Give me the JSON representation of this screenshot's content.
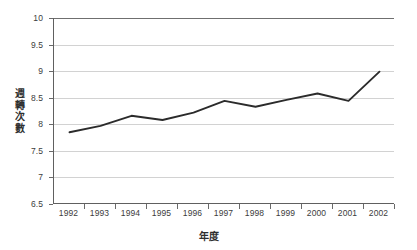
{
  "chart_data": {
    "type": "line",
    "title": "",
    "subtitle": "",
    "xlabel": "年度",
    "ylabel": "週轉次數",
    "ylabel_chars": [
      "週",
      "轉",
      "次",
      "數"
    ],
    "categories": [
      "1992",
      "1993",
      "1994",
      "1995",
      "1996",
      "1997",
      "1998",
      "1999",
      "2000",
      "2001",
      "2002"
    ],
    "values": [
      7.85,
      7.97,
      8.16,
      8.08,
      8.22,
      8.44,
      8.33,
      8.46,
      8.58,
      8.44,
      8.99
    ],
    "series": [
      {
        "name": "週轉次數",
        "values": [
          7.85,
          7.97,
          8.16,
          8.08,
          8.22,
          8.44,
          8.33,
          8.46,
          8.58,
          8.44,
          8.99
        ]
      }
    ],
    "ylim": [
      6.5,
      10
    ],
    "yticks": [
      6.5,
      7,
      7.5,
      8,
      8.5,
      9,
      9.5,
      10
    ],
    "ytick_labels": [
      "6.5",
      "7",
      "7.5",
      "8",
      "8.5",
      "9",
      "9.5",
      "10"
    ],
    "xlim_categories": true,
    "grid": "horizontal",
    "legend": "none",
    "legend_position": "none",
    "markers": false,
    "line_color": "#2b2b2b",
    "grid_color": "#d2d2d2",
    "axis_color": "#606060",
    "background_color": "#ffffff",
    "annotations": []
  }
}
